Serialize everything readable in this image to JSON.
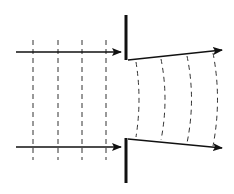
{
  "diagram": {
    "colors": {
      "line": "#111111",
      "dash": "#333333",
      "background": "#ffffff"
    },
    "incident_wavefronts_x": [
      33,
      58,
      82,
      106
    ],
    "diffracted_wavefronts_x": [
      139,
      165,
      191,
      216
    ],
    "barrier": {
      "x": 126,
      "top_segment": [
        15,
        60
      ],
      "bottom_segment": [
        138,
        183
      ]
    },
    "incident_rays": [
      {
        "from": [
          16,
          52
        ],
        "to": [
          120,
          52
        ]
      },
      {
        "from": [
          16,
          147
        ],
        "to": [
          120,
          147
        ]
      }
    ],
    "diffracted_rays": [
      {
        "from": [
          128,
          60
        ],
        "to": [
          222,
          50
        ]
      },
      {
        "from": [
          128,
          139
        ],
        "to": [
          222,
          148
        ]
      }
    ]
  }
}
